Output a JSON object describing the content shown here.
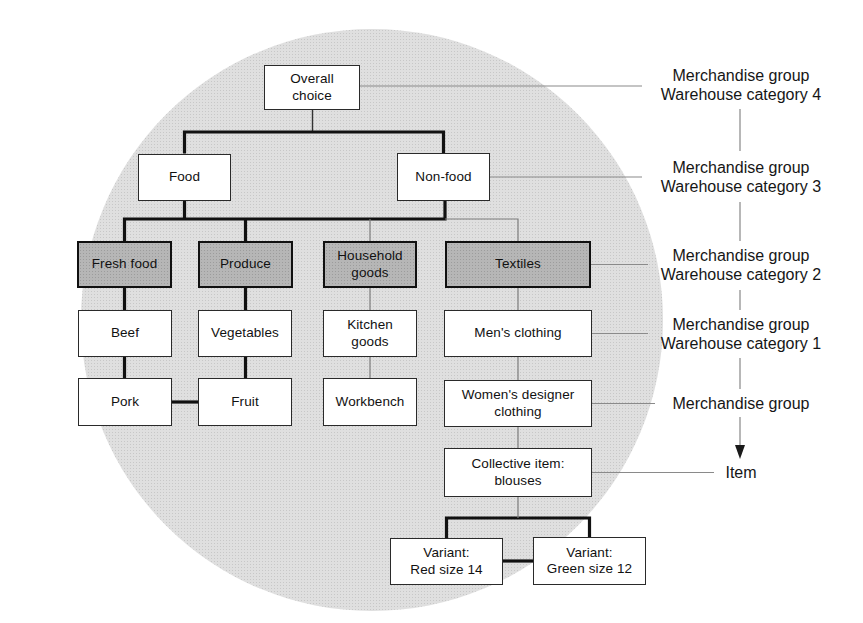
{
  "diagram": {
    "nodes": {
      "overall_choice": "Overall\nchoice",
      "food": "Food",
      "non_food": "Non-food",
      "fresh_food": "Fresh food",
      "produce": "Produce",
      "household_goods": "Household\ngoods",
      "textiles": "Textiles",
      "beef": "Beef",
      "vegetables": "Vegetables",
      "kitchen_goods": "Kitchen\ngoods",
      "mens_clothing": "Men's clothing",
      "pork": "Pork",
      "fruit": "Fruit",
      "workbench": "Workbench",
      "womens_designer_clothing": "Women's designer\nclothing",
      "collective_item": "Collective item:\nblouses",
      "variant_red": "Variant:\nRed size 14",
      "variant_green": "Variant:\nGreen size 12"
    },
    "edges": [
      [
        "overall_choice",
        "food"
      ],
      [
        "overall_choice",
        "non_food"
      ],
      [
        "food",
        "fresh_food"
      ],
      [
        "food",
        "produce"
      ],
      [
        "non_food",
        "household_goods"
      ],
      [
        "non_food",
        "textiles"
      ],
      [
        "fresh_food",
        "beef"
      ],
      [
        "beef",
        "pork"
      ],
      [
        "produce",
        "vegetables"
      ],
      [
        "vegetables",
        "fruit"
      ],
      [
        "household_goods",
        "kitchen_goods"
      ],
      [
        "kitchen_goods",
        "workbench"
      ],
      [
        "textiles",
        "mens_clothing"
      ],
      [
        "mens_clothing",
        "womens_designer_clothing"
      ],
      [
        "womens_designer_clothing",
        "collective_item"
      ],
      [
        "collective_item",
        "variant_red"
      ],
      [
        "collective_item",
        "variant_green"
      ]
    ],
    "sibling_links": [
      [
        "pork",
        "fruit"
      ],
      [
        "variant_red",
        "variant_green"
      ]
    ],
    "side_labels": {
      "cat4": {
        "line1": "Merchandise group",
        "line2": "Warehouse category 4"
      },
      "cat3": {
        "line1": "Merchandise group",
        "line2": "Warehouse category 3"
      },
      "cat2": {
        "line1": "Merchandise group",
        "line2": "Warehouse category 2"
      },
      "cat1": {
        "line1": "Merchandise group",
        "line2": "Warehouse category 1"
      },
      "merchandise_group": {
        "line1": "Merchandise group"
      },
      "item": {
        "line1": "Item"
      }
    },
    "colors": {
      "circle_fill": "#dfdfdf",
      "shaded_box_fill": "#b6b6b6",
      "box_fill": "#ffffff",
      "line_thick": "#111111",
      "line_thin": "#7c7c7c",
      "text": "#161616"
    }
  }
}
